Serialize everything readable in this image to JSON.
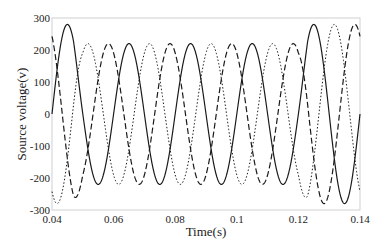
{
  "chart_data": {
    "type": "line",
    "title": "",
    "xlabel": "Time(s)",
    "ylabel": "Source voltage(v)",
    "xlim": [
      0.04,
      0.14
    ],
    "ylim": [
      -300,
      300
    ],
    "xticks": [
      "0.04",
      "0.06",
      "0.08",
      "0.1",
      "0.12",
      "0.14"
    ],
    "yticks": [
      "300",
      "200",
      "100",
      "0",
      "-100",
      "-200",
      "-300"
    ],
    "grid": false,
    "legend": null,
    "frequency_hz": 50,
    "series": [
      {
        "name": "Phase A",
        "style": "solid",
        "phase_deg": 0,
        "amplitude_normal": 280,
        "amplitude_sag": 220
      },
      {
        "name": "Phase B",
        "style": "dashed",
        "phase_deg": 120,
        "amplitude_normal": 280,
        "amplitude_sag": 220
      },
      {
        "name": "Phase C",
        "style": "dotted",
        "phase_deg": -120,
        "amplitude_normal": 280,
        "amplitude_sag": 220
      }
    ],
    "sag_interval": [
      0.05,
      0.12
    ],
    "annotations": []
  },
  "colors": {
    "line": "#1a1a1a",
    "axis": "#d0d0d0",
    "text": "#222222"
  }
}
